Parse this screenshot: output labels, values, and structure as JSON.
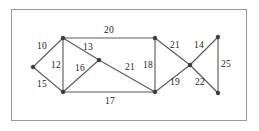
{
  "figure": {
    "background_color": "#ffffff",
    "frame_color": "#9a9a9a",
    "edge_color": "#5d5d5d",
    "node_color": "#3a3a3a",
    "label_color": "#1c1c1c"
  },
  "chart_data": {
    "type": "diagram",
    "subtype": "weighted-undirected-graph",
    "title": "",
    "xlabel": "",
    "ylabel": "",
    "grid": false,
    "legend": null,
    "nodes": [
      {
        "id": "A",
        "label": "",
        "x": 33,
        "y": 67
      },
      {
        "id": "B",
        "label": "",
        "x": 63,
        "y": 38
      },
      {
        "id": "C",
        "label": "",
        "x": 63,
        "y": 92
      },
      {
        "id": "D",
        "label": "",
        "x": 99,
        "y": 60
      },
      {
        "id": "E",
        "label": "",
        "x": 155,
        "y": 38
      },
      {
        "id": "F",
        "label": "",
        "x": 155,
        "y": 92
      },
      {
        "id": "G",
        "label": "",
        "x": 190,
        "y": 65
      },
      {
        "id": "H",
        "label": "",
        "x": 218,
        "y": 37
      },
      {
        "id": "I",
        "label": "",
        "x": 218,
        "y": 93
      }
    ],
    "edges": [
      {
        "source": "A",
        "target": "B",
        "weight": 10,
        "label_x": 42,
        "label_y": 47
      },
      {
        "source": "A",
        "target": "C",
        "weight": 15,
        "label_x": 42,
        "label_y": 85
      },
      {
        "source": "B",
        "target": "C",
        "weight": 12,
        "label_x": 56,
        "label_y": 66
      },
      {
        "source": "B",
        "target": "D",
        "weight": 13,
        "label_x": 88,
        "label_y": 48
      },
      {
        "source": "B",
        "target": "E",
        "weight": 20,
        "label_x": 109,
        "label_y": 31
      },
      {
        "source": "C",
        "target": "D",
        "weight": 16,
        "label_x": 80,
        "label_y": 69
      },
      {
        "source": "C",
        "target": "F",
        "weight": 17,
        "label_x": 110,
        "label_y": 102
      },
      {
        "source": "D",
        "target": "F",
        "weight": 21,
        "label_x": 130,
        "label_y": 68
      },
      {
        "source": "E",
        "target": "F",
        "weight": 18,
        "label_x": 148,
        "label_y": 66
      },
      {
        "source": "E",
        "target": "G",
        "weight": 21,
        "label_x": 175,
        "label_y": 46
      },
      {
        "source": "F",
        "target": "G",
        "weight": 19,
        "label_x": 175,
        "label_y": 83
      },
      {
        "source": "G",
        "target": "H",
        "weight": 14,
        "label_x": 199,
        "label_y": 46
      },
      {
        "source": "G",
        "target": "I",
        "weight": 22,
        "label_x": 200,
        "label_y": 83
      },
      {
        "source": "H",
        "target": "I",
        "weight": 25,
        "label_x": 226,
        "label_y": 65
      }
    ],
    "weights": [
      10,
      15,
      12,
      13,
      20,
      16,
      17,
      21,
      18,
      21,
      19,
      14,
      22,
      25
    ],
    "node_count": 9,
    "edge_count": 14
  }
}
